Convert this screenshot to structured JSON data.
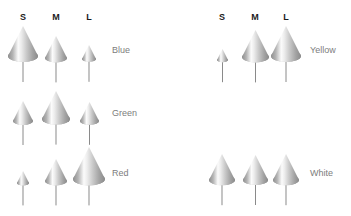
{
  "figure": {
    "title": "",
    "background_color": "#ffffff",
    "width": 351,
    "height": 216,
    "cone_fill_light": "#fbfbfb",
    "cone_fill_mid": "#c9c9c9",
    "cone_fill_dark": "#8f8f8f",
    "cone_edge_color": "#9a9a9a",
    "stem_color": "#8a8a8a",
    "header_color": "#1b1b1b",
    "label_color": "#7d7d7d"
  },
  "chart_data": {
    "type": "bar",
    "title": "",
    "subtitle": "",
    "xlabel": "",
    "ylabel": "",
    "glyph": "cone",
    "categories": [
      "S",
      "M",
      "L"
    ],
    "legend_position": "right-of-row",
    "grid": false,
    "value_units": "cone base width (px)",
    "series": [
      {
        "name": "Blue",
        "panel": "left",
        "values": [
          30,
          22,
          14
        ]
      },
      {
        "name": "Green",
        "panel": "left",
        "values": [
          20,
          28,
          19
        ]
      },
      {
        "name": "Red",
        "panel": "left",
        "values": [
          12,
          22,
          32
        ]
      },
      {
        "name": "Yellow",
        "panel": "right",
        "values": [
          11,
          27,
          30
        ]
      },
      {
        "name": "White",
        "panel": "right",
        "values": [
          26,
          25,
          26
        ]
      }
    ]
  },
  "panels": [
    {
      "id": "left-panel",
      "headers": [
        {
          "label": "S",
          "x": 23
        },
        {
          "label": "M",
          "x": 56
        },
        {
          "label": "L",
          "x": 89
        }
      ],
      "header_y": 12,
      "rows": [
        {
          "name": "Blue",
          "label": "Blue",
          "label_x": 112,
          "label_y": 45,
          "baseline_y": 62,
          "cones": [
            {
              "size": "S",
              "cx": 23,
              "width": 30,
              "height": 30,
              "stem": 20
            },
            {
              "size": "M",
              "cx": 56,
              "width": 22,
              "height": 22,
              "stem": 20
            },
            {
              "size": "L",
              "cx": 89,
              "width": 14,
              "height": 14,
              "stem": 20
            }
          ]
        },
        {
          "name": "Green",
          "label": "Green",
          "label_x": 112,
          "label_y": 108,
          "baseline_y": 125,
          "cones": [
            {
              "size": "S",
              "cx": 23,
              "width": 20,
              "height": 20,
              "stem": 20
            },
            {
              "size": "M",
              "cx": 56,
              "width": 28,
              "height": 28,
              "stem": 20
            },
            {
              "size": "L",
              "cx": 89,
              "width": 19,
              "height": 19,
              "stem": 20
            }
          ]
        },
        {
          "name": "Red",
          "label": "Red",
          "label_x": 112,
          "label_y": 168,
          "baseline_y": 185,
          "cones": [
            {
              "size": "S",
              "cx": 23,
              "width": 12,
              "height": 12,
              "stem": 20
            },
            {
              "size": "M",
              "cx": 56,
              "width": 22,
              "height": 22,
              "stem": 20
            },
            {
              "size": "L",
              "cx": 89,
              "width": 32,
              "height": 32,
              "stem": 20
            }
          ]
        }
      ]
    },
    {
      "id": "right-panel",
      "headers": [
        {
          "label": "S",
          "x": 222
        },
        {
          "label": "M",
          "x": 255
        },
        {
          "label": "L",
          "x": 286
        }
      ],
      "header_y": 12,
      "rows": [
        {
          "name": "Yellow",
          "label": "Yellow",
          "label_x": 310,
          "label_y": 45,
          "baseline_y": 62,
          "cones": [
            {
              "size": "S",
              "cx": 222,
              "width": 11,
              "height": 11,
              "stem": 20
            },
            {
              "size": "M",
              "cx": 255,
              "width": 27,
              "height": 27,
              "stem": 20
            },
            {
              "size": "L",
              "cx": 286,
              "width": 30,
              "height": 30,
              "stem": 20
            }
          ]
        },
        {
          "name": "White",
          "label": "White",
          "label_x": 310,
          "label_y": 168,
          "baseline_y": 185,
          "cones": [
            {
              "size": "S",
              "cx": 222,
              "width": 26,
              "height": 26,
              "stem": 20
            },
            {
              "size": "M",
              "cx": 255,
              "width": 25,
              "height": 25,
              "stem": 20
            },
            {
              "size": "L",
              "cx": 286,
              "width": 26,
              "height": 26,
              "stem": 20
            }
          ]
        }
      ]
    }
  ]
}
